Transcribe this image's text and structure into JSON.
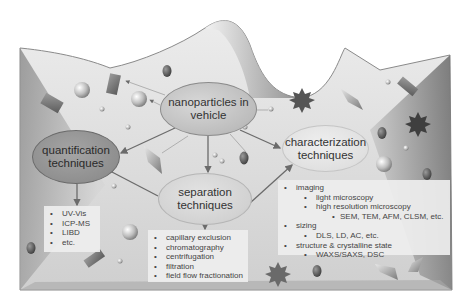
{
  "diagram": {
    "title": "",
    "palette": {
      "background": "#ffffff",
      "surface_light": "#f2f2f2",
      "surface_dark": "#8c8c8c",
      "node_dark": "#8f8f8f",
      "node_mid": "#bdbdbd",
      "node_light": "#d2d2d2",
      "node_lightest": "#e0e0e0",
      "text": "#333333",
      "arrow": "#6b6b6b"
    },
    "nodes": {
      "center": {
        "id": "nano",
        "line1": "nanoparticles in",
        "line2": "vehicle"
      },
      "quantification": {
        "id": "quant",
        "line1": "quantification",
        "line2": "techniques"
      },
      "separation": {
        "id": "sep",
        "line1": "separation",
        "line2": "techniques"
      },
      "characterization": {
        "id": "char",
        "line1": "characterization",
        "line2": "techniques"
      }
    },
    "edges": [
      {
        "from": "nano",
        "to": "quant"
      },
      {
        "from": "nano",
        "to": "sep"
      },
      {
        "from": "nano",
        "to": "char"
      },
      {
        "from": "quant",
        "to": "sep"
      },
      {
        "from": "sep",
        "to": "char"
      },
      {
        "from": "quant",
        "to": "quant_list"
      },
      {
        "from": "sep",
        "to": "sep_list"
      }
    ],
    "lists": {
      "quantification": {
        "items": [
          "UV-Vis",
          "ICP-MS",
          "LIBD",
          "etc."
        ]
      },
      "separation": {
        "items": [
          "capillary exclusion",
          "chromatography",
          "centrifugation",
          "filtration",
          "field flow fractionation"
        ]
      },
      "characterization": {
        "items": [
          {
            "level": 1,
            "text": "imaging"
          },
          {
            "level": 2,
            "text": "light microscopy"
          },
          {
            "level": 2,
            "text": "high resolution microscopy"
          },
          {
            "level": 3,
            "text": "SEM, TEM, AFM, CLSM, etc."
          },
          {
            "level": 1,
            "text": "sizing"
          },
          {
            "level": 2,
            "text": "DLS, LD, AC, etc."
          },
          {
            "level": 1,
            "text": "structure & crystalline state"
          },
          {
            "level": 2,
            "text": "WAXS/SAXS, DSC"
          }
        ]
      }
    },
    "decorations": [
      "sphere-icon",
      "rectangular-prism-icon",
      "octahedron-icon",
      "star-burst-icon",
      "ellipsoid-icon",
      "small-dot-icon"
    ]
  }
}
